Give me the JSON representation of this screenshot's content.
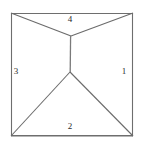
{
  "figure": {
    "background_color": "#ffffff",
    "stroke_color": "#6e6e6e",
    "label_color": "#2b2b2b",
    "square": {
      "top_left": [
        11,
        13
      ],
      "top_right": [
        133,
        13
      ],
      "bottom_right": [
        133,
        136
      ],
      "bottom_left": [
        11,
        136
      ]
    },
    "nodes": {
      "upper_junction": [
        71,
        36
      ],
      "lower_junction": [
        70,
        72
      ]
    },
    "edges": [
      {
        "name": "square-top-edge",
        "from": [
          11,
          13
        ],
        "to": [
          133,
          13
        ]
      },
      {
        "name": "square-right-edge",
        "from": [
          133,
          13
        ],
        "to": [
          133,
          136
        ]
      },
      {
        "name": "square-bottom-edge",
        "from": [
          133,
          136
        ],
        "to": [
          11,
          136
        ]
      },
      {
        "name": "square-left-edge",
        "from": [
          11,
          136
        ],
        "to": [
          11,
          13
        ]
      },
      {
        "name": "upper-left-spoke",
        "from": [
          11,
          13
        ],
        "to": [
          71,
          36
        ]
      },
      {
        "name": "upper-right-spoke",
        "from": [
          133,
          13
        ],
        "to": [
          71,
          36
        ]
      },
      {
        "name": "central-stem",
        "from": [
          71,
          36
        ],
        "to": [
          70,
          72
        ]
      },
      {
        "name": "lower-left-spoke",
        "from": [
          70,
          72
        ],
        "to": [
          11,
          136
        ]
      },
      {
        "name": "lower-right-spoke",
        "from": [
          70,
          72
        ],
        "to": [
          133,
          136
        ]
      }
    ],
    "regions": [
      {
        "id": "right",
        "label": "1"
      },
      {
        "id": "bottom",
        "label": "2"
      },
      {
        "id": "left",
        "label": "3"
      },
      {
        "id": "top",
        "label": "4"
      }
    ]
  }
}
